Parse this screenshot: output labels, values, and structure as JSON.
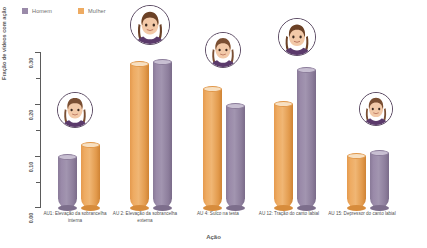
{
  "chart_data": {
    "type": "bar",
    "title": "",
    "xlabel": "Ação",
    "ylabel": "Fração de vídeos com ação",
    "ylim": [
      0.0,
      0.3
    ],
    "yticks": [
      "0.00",
      "0.10",
      "0.20",
      "0.30"
    ],
    "grid": false,
    "legend_position": "top-left",
    "categories": [
      "AU1: Elevação da sobrancelha interna",
      "AU 2: Elevação da sobrancelha externa",
      "AU 4: Sulco na testa",
      "AU 12: Tração do canto labial",
      "AU 15: Depressor do canto labial"
    ],
    "series": [
      {
        "name": "Homem",
        "color": "#9a8aa9",
        "values": [
          0.099,
          0.283,
          0.197,
          0.267,
          0.106
        ]
      },
      {
        "name": "Mulher",
        "color": "#eeab62",
        "values": [
          0.122,
          0.279,
          0.23,
          0.201,
          0.101
        ]
      }
    ]
  },
  "legend": {
    "items": [
      {
        "label": "Homem",
        "color": "#9a8aa9"
      },
      {
        "label": "Mulher",
        "color": "#eeab62"
      }
    ]
  },
  "axes": {
    "y_title": "Fração de vídeos com ação",
    "x_title": "Ação",
    "y_tick_labels": [
      "0.00",
      "0.10",
      "0.20",
      "0.30"
    ]
  },
  "avatars": [
    {
      "name": "avatar-group-1"
    },
    {
      "name": "avatar-group-2"
    },
    {
      "name": "avatar-group-3"
    },
    {
      "name": "avatar-group-4"
    },
    {
      "name": "avatar-group-5"
    }
  ]
}
